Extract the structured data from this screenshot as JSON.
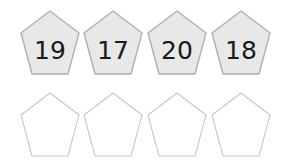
{
  "worksheet": {
    "title": "Pentagon Number Worksheet",
    "background_color": "#ffffff",
    "rows": [
      {
        "id": "filled-row",
        "name": "numbered-pentagons",
        "style": "filled",
        "fill_color": "#e8e8e8",
        "stroke_color": "#b0b0b0",
        "text_color": "#1a1a1a",
        "cells": [
          {
            "name": "pentagon-19",
            "value": "19"
          },
          {
            "name": "pentagon-17",
            "value": "17"
          },
          {
            "name": "pentagon-20",
            "value": "20"
          },
          {
            "name": "pentagon-18",
            "value": "18"
          }
        ]
      },
      {
        "id": "empty-row",
        "name": "blank-pentagons",
        "style": "outline",
        "fill_color": "#ffffff",
        "stroke_color": "#c8c8c8",
        "text_color": "#1a1a1a",
        "cells": [
          {
            "name": "pentagon-blank-1",
            "value": ""
          },
          {
            "name": "pentagon-blank-2",
            "value": ""
          },
          {
            "name": "pentagon-blank-3",
            "value": ""
          },
          {
            "name": "pentagon-blank-4",
            "value": ""
          }
        ]
      }
    ]
  }
}
